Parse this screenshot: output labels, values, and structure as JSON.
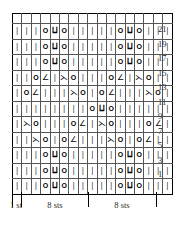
{
  "chart_data": {
    "type": "table",
    "columns": 17,
    "rows": 11,
    "row_labels": [
      "21",
      "19",
      "17",
      "15",
      "13",
      "11",
      "9",
      "7",
      "5",
      "3",
      "1"
    ],
    "symbol_glyphs": {
      "k": "|",
      "yo": "O",
      "k2tog": "∠",
      "ssk": "⋋",
      "cdd": "⨿"
    },
    "symbol_names": {
      "k": "knit",
      "yo": "yarn-over",
      "k2tog": "left-leaning-decrease",
      "ssk": "right-leaning-decrease",
      "cdd": "central-double-decrease"
    },
    "grid": [
      [
        "k",
        "k",
        "k",
        "yo",
        "cdd",
        "yo",
        "k",
        "k",
        "k",
        "k",
        "k",
        "yo",
        "cdd",
        "yo",
        "k",
        "k",
        "k"
      ],
      [
        "k",
        "k",
        "k",
        "yo",
        "cdd",
        "yo",
        "k",
        "k",
        "k",
        "k",
        "k",
        "yo",
        "cdd",
        "yo",
        "k",
        "k",
        "k"
      ],
      [
        "k",
        "k",
        "k",
        "yo",
        "cdd",
        "yo",
        "k",
        "k",
        "k",
        "k",
        "k",
        "yo",
        "cdd",
        "yo",
        "k",
        "k",
        "k"
      ],
      [
        "k",
        "k",
        "yo",
        "k2tog",
        "k",
        "ssk",
        "yo",
        "k",
        "k",
        "k",
        "yo",
        "k2tog",
        "k",
        "ssk",
        "yo",
        "k",
        "k"
      ],
      [
        "k",
        "yo",
        "k2tog",
        "k",
        "k",
        "k",
        "ssk",
        "yo",
        "k",
        "yo",
        "k2tog",
        "k",
        "k",
        "k",
        "ssk",
        "yo",
        "k"
      ],
      [
        "k",
        "k",
        "k",
        "k",
        "k",
        "k",
        "k",
        "k",
        "yo",
        "cdd",
        "yo",
        "k",
        "k",
        "k",
        "k",
        "k",
        "k"
      ],
      [
        "k",
        "ssk",
        "yo",
        "k",
        "k",
        "k",
        "yo",
        "k2tog",
        "k",
        "ssk",
        "yo",
        "k",
        "k",
        "k",
        "yo",
        "k2tog",
        "k"
      ],
      [
        "k",
        "k",
        "ssk",
        "yo",
        "k",
        "yo",
        "k2tog",
        "k",
        "k",
        "k",
        "ssk",
        "yo",
        "k",
        "yo",
        "k2tog",
        "k",
        "k"
      ],
      [
        "k",
        "k",
        "k",
        "yo",
        "cdd",
        "yo",
        "k",
        "k",
        "k",
        "k",
        "k",
        "yo",
        "cdd",
        "yo",
        "k",
        "k",
        "k"
      ],
      [
        "k",
        "k",
        "k",
        "yo",
        "cdd",
        "yo",
        "k",
        "k",
        "k",
        "k",
        "k",
        "yo",
        "cdd",
        "yo",
        "k",
        "k",
        "k"
      ],
      [
        "k",
        "k",
        "k",
        "yo",
        "cdd",
        "yo",
        "k",
        "k",
        "k",
        "k",
        "k",
        "yo",
        "cdd",
        "yo",
        "k",
        "k",
        "k"
      ]
    ],
    "repeat_separator_columns": [
      1,
      9
    ],
    "footer_labels": [
      {
        "text": "1 st",
        "center_x": 16
      },
      {
        "text": "8 sts",
        "center_x": 55
      },
      {
        "text": "8 sts",
        "center_x": 122
      }
    ],
    "footer_tick_x": [
      12,
      21,
      88,
      156
    ],
    "xlabel": "",
    "ylabel": "",
    "grid_on": true
  }
}
